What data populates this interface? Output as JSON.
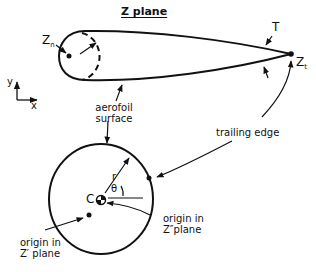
{
  "title": "Z plane",
  "labels": {
    "leading_point": "Z",
    "leading_point_sub": "n",
    "trailing_point": "Z",
    "trailing_point_sub": "t",
    "thickness": "T",
    "axis_x": "x",
    "axis_y": "y",
    "aerofoil_surface_line1": "aerofoil",
    "aerofoil_surface_line2": "surface",
    "trailing_edge": "trailing edge",
    "center": "C",
    "radius": "r",
    "angle": "θ",
    "origin_z_double_prime_line1": "origin in",
    "origin_z_double_prime_line2": "Z″plane",
    "origin_z_prime_line1": "origin in",
    "origin_z_prime_line2": "Z′ plane"
  },
  "colors": {
    "stroke": "#111111",
    "background": "#ffffff"
  }
}
